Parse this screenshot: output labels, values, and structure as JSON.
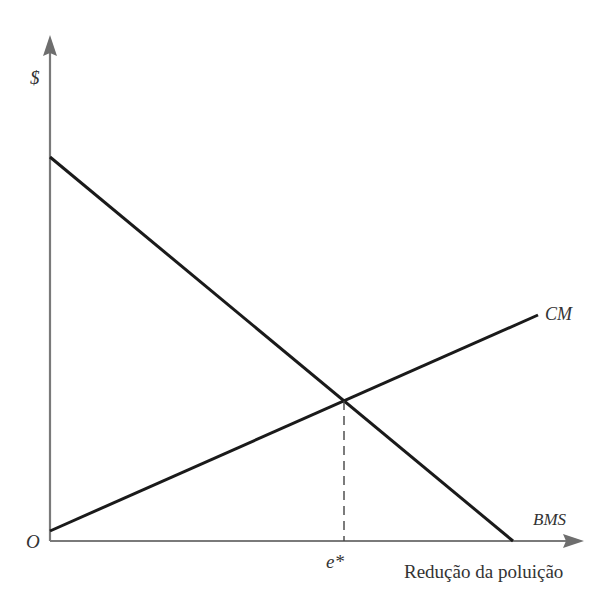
{
  "diagram": {
    "y_axis_label": "$",
    "x_axis_label": "Redução da poluição",
    "origin_label": "O",
    "equilibrium_label": "e*",
    "curves": [
      {
        "name": "CM",
        "label": "CM",
        "description": "Custo marginal (upward sloping)"
      },
      {
        "name": "BMS",
        "label": "BMS",
        "description": "Benefício marginal social (downward sloping)"
      }
    ],
    "colors": {
      "axis": "#777777",
      "curve": "#1a1a1a",
      "text": "#333333",
      "dashed": "#444444"
    }
  },
  "geometry": {
    "origin": [
      50,
      541
    ],
    "y_axis_top": [
      50,
      35
    ],
    "x_axis_right": [
      584,
      541
    ],
    "bms": {
      "start": [
        50,
        157
      ],
      "end": [
        513,
        541
      ]
    },
    "cm": {
      "start": [
        50,
        531
      ],
      "end": [
        538,
        315
      ]
    },
    "intersection": [
      344,
      401
    ]
  }
}
